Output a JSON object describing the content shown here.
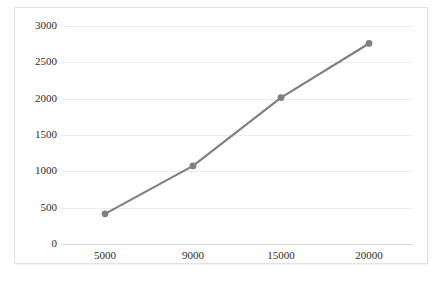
{
  "chart_data": {
    "type": "line",
    "title": "",
    "xlabel": "",
    "ylabel": "",
    "x": [
      5000,
      9000,
      15000,
      20000
    ],
    "categories": [
      "5000",
      "9000",
      "15000",
      "20000"
    ],
    "values": [
      415,
      1075,
      2015,
      2760
    ],
    "series": [
      {
        "name": "Series 1",
        "values": [
          415,
          1075,
          2015,
          2760
        ]
      }
    ],
    "xtick_labels": [
      "5000",
      "9000",
      "15000",
      "20000"
    ],
    "ytick_labels": [
      "0",
      "500",
      "1000",
      "1500",
      "2000",
      "2500",
      "3000"
    ],
    "ytick_values": [
      0,
      500,
      1000,
      1500,
      2000,
      2500,
      3000
    ],
    "ylim": [
      0,
      3000
    ],
    "grid": true,
    "grid_axis": "y",
    "legend": false,
    "legend_position": "none",
    "markers": true,
    "marker_shape": "circle",
    "line_color": "#808080",
    "marker_color": "#808080",
    "grid_color": "#ececec",
    "axis_color": "#dcdcdc",
    "border_color": "#e3e3e3",
    "background_color": "#ffffff",
    "text_color": "#2b2b2b"
  }
}
